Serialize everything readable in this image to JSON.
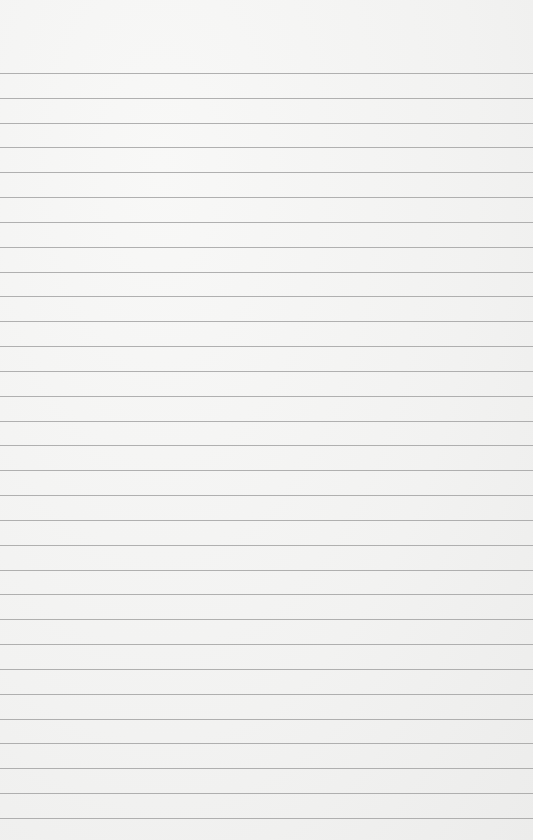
{
  "paper": {
    "type": "lined-paper",
    "background_color": "#f4f4f3",
    "line_color": "#a3a3a3",
    "first_line_y": 73,
    "line_spacing": 24.83,
    "line_count": 31
  }
}
